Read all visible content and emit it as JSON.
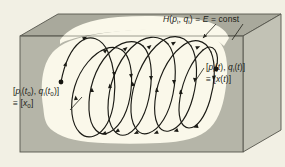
{
  "figure": {
    "labels": {
      "hamiltonian": {
        "text": "H(pi, qi) = E = const",
        "parts": {
          "h": "H",
          "open": "(",
          "p": "p",
          "p_sub": "i",
          "comma": ", ",
          "q": "q",
          "q_sub": "i",
          "close": ")",
          "eq1": " = ",
          "e": "E",
          "eq2": " = const"
        }
      },
      "initial_state": {
        "line1": {
          "open_bracket": "[",
          "p": "p",
          "p_sub": "i",
          "t_open": "(",
          "t": "t",
          "t_sub": "0",
          "t_close": ")",
          "comma": ", ",
          "q": "q",
          "q_sub": "i",
          "t2_open": "(",
          "t2": "t",
          "t2_sub": "0",
          "t2_close": ")",
          "close_bracket": "]"
        },
        "line2": {
          "equiv": "≡ ",
          "open_bracket": "[",
          "x": "x",
          "x_sub": "0",
          "close_bracket": "]"
        }
      },
      "final_state": {
        "line1": {
          "open_bracket": "[",
          "p": "p",
          "p_sub": "i",
          "t_open": "(",
          "t": "t",
          "t_close": ")",
          "comma": ", ",
          "q": "q",
          "q_sub": "i",
          "t2_open": "(",
          "t2": "t",
          "t2_close": ")",
          "close_bracket": "]"
        },
        "line2": {
          "equiv": "≡ ",
          "open_bracket": "[",
          "x": "x",
          "t_open": "(",
          "t": "t",
          "t_close": ")",
          "close_bracket": "]"
        }
      }
    },
    "colors": {
      "background": "#f2f0e4",
      "box_front_face": "#b3b3a6",
      "box_side_face": "#c3c3b6",
      "box_top_face": "#a8a89b",
      "energy_surface": "#faf8ea",
      "trajectory_stroke": "#1a1a14",
      "outline": "#3a3a32",
      "label_text": "#201d17"
    },
    "geometry": {
      "box_front": [
        [
          20,
          24
        ],
        [
          20,
          152
        ],
        [
          243,
          152
        ],
        [
          243,
          24
        ]
      ],
      "box_depth_x": 40,
      "box_depth_y": -20
    }
  }
}
